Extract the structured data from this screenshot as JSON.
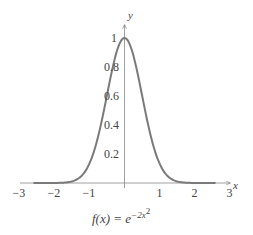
{
  "chart_data": {
    "type": "line",
    "xlabel": "x",
    "ylabel": "y",
    "xlim": [
      -3,
      3
    ],
    "ylim": [
      0,
      1
    ],
    "xticks": [
      "-3",
      "-2",
      "-1",
      "1",
      "2",
      "3"
    ],
    "yticks": [
      "0.2",
      "0.4",
      "0.6",
      "0.8",
      "1"
    ],
    "grid": false,
    "series": [
      {
        "name": "f(x) = e^{-2x^2}",
        "x": [
          -2.5,
          -2,
          -1.5,
          -1,
          -0.75,
          -0.5,
          -0.25,
          0,
          0.25,
          0.5,
          0.75,
          1,
          1.5,
          2,
          2.5
        ],
        "values": [
          0.0,
          0.0003,
          0.011,
          0.135,
          0.325,
          0.607,
          0.882,
          1.0,
          0.882,
          0.607,
          0.325,
          0.135,
          0.011,
          0.0003,
          0.0
        ]
      }
    ]
  },
  "labels": {
    "x_axis": "x",
    "y_axis": "y",
    "xticks": [
      {
        "text": "−3",
        "x": -3
      },
      {
        "text": "−2",
        "x": -2
      },
      {
        "text": "−1",
        "x": -1
      },
      {
        "text": "1",
        "x": 1
      },
      {
        "text": "2",
        "x": 2
      },
      {
        "text": "3",
        "x": 3
      }
    ],
    "yticks": [
      {
        "text": "0.2",
        "y": 0.2
      },
      {
        "text": "0.4",
        "y": 0.4
      },
      {
        "text": "0.6",
        "y": 0.6
      },
      {
        "text": "0.8",
        "y": 0.8
      },
      {
        "text": "1",
        "y": 1
      }
    ],
    "formula_lhs": "f(x) = e",
    "formula_exp": "−2x",
    "formula_exp2": "2"
  },
  "colors": {
    "curve": "#7a7a7a",
    "axis": "#777777"
  }
}
